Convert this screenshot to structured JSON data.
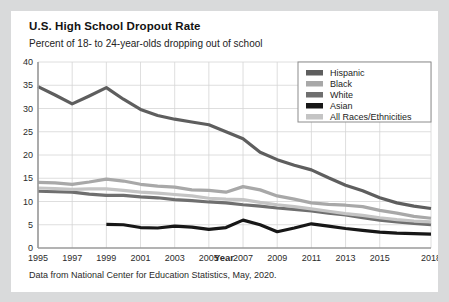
{
  "card": {
    "title": "U.S. High School Dropout Rate",
    "subtitle": "Percent of 18- to 24-year-olds dropping out of school",
    "source": "Data from National Center for Education Statistics, May, 2020."
  },
  "chart_data": {
    "type": "line",
    "title": "U.S. High School Dropout Rate",
    "subtitle": "Percent of 18- to 24-year-olds dropping out of school",
    "xlabel": "Year",
    "ylabel": "",
    "xlim": [
      1995,
      2018
    ],
    "ylim": [
      0,
      40
    ],
    "ytick_step": 5,
    "yticks": [
      0,
      5,
      10,
      15,
      20,
      25,
      30,
      35,
      40
    ],
    "xticks": [
      1995,
      1997,
      1999,
      2001,
      2003,
      2005,
      2007,
      2009,
      2011,
      2013,
      2015,
      2018
    ],
    "grid": true,
    "legend_position": "top-right",
    "x": [
      1995,
      1996,
      1997,
      1998,
      1999,
      2000,
      2001,
      2002,
      2003,
      2004,
      2005,
      2006,
      2007,
      2008,
      2009,
      2010,
      2011,
      2012,
      2013,
      2014,
      2015,
      2016,
      2017,
      2018
    ],
    "series": [
      {
        "name": "Hispanic",
        "color": "#5e5e5e",
        "values": [
          34.7,
          32.9,
          31.0,
          32.7,
          34.5,
          32.0,
          29.8,
          28.5,
          27.7,
          27.1,
          26.5,
          25.0,
          23.5,
          20.6,
          19.0,
          17.8,
          16.8,
          15.1,
          13.5,
          12.3,
          10.8,
          9.7,
          9.0,
          8.5
        ]
      },
      {
        "name": "Black",
        "color": "#a8a8a8",
        "values": [
          14.1,
          14.0,
          13.7,
          14.2,
          14.8,
          14.4,
          13.7,
          13.3,
          13.1,
          12.5,
          12.4,
          12.0,
          13.2,
          12.5,
          11.2,
          10.5,
          9.7,
          9.4,
          9.2,
          8.9,
          8.1,
          7.5,
          6.8,
          6.4
        ]
      },
      {
        "name": "White",
        "color": "#6f6f6f",
        "values": [
          12.2,
          12.1,
          12.0,
          11.6,
          11.3,
          11.3,
          11.0,
          10.8,
          10.4,
          10.2,
          9.9,
          9.7,
          9.3,
          9.0,
          8.6,
          8.3,
          8.0,
          7.5,
          7.1,
          6.5,
          6.0,
          5.6,
          5.3,
          5.0
        ]
      },
      {
        "name": "Asian",
        "color": "#171717",
        "values": [
          null,
          null,
          null,
          null,
          5.1,
          5.0,
          4.4,
          4.3,
          4.7,
          4.5,
          4.0,
          4.4,
          6.0,
          5.0,
          3.5,
          4.3,
          5.2,
          4.7,
          4.2,
          3.8,
          3.4,
          3.2,
          3.1,
          3.0
        ]
      },
      {
        "name": "All Races/Ethnicities",
        "color": "#c4c4c4",
        "values": [
          12.9,
          12.8,
          12.6,
          12.7,
          12.7,
          12.4,
          12.0,
          11.8,
          11.5,
          11.2,
          10.7,
          10.5,
          10.4,
          9.8,
          9.3,
          8.9,
          8.4,
          7.9,
          7.4,
          7.0,
          6.5,
          6.1,
          5.8,
          5.6
        ]
      }
    ]
  }
}
